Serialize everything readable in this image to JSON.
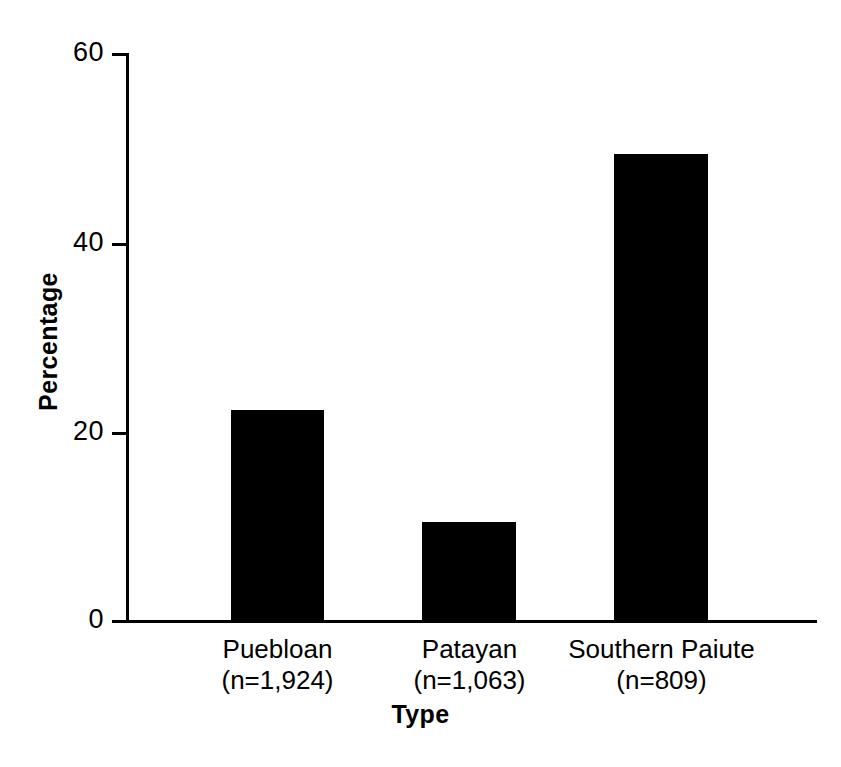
{
  "chart_data": {
    "type": "bar",
    "title": "",
    "subtitle": "",
    "xlabel": "Type",
    "ylabel": "Percentage",
    "categories": [
      "Puebloan",
      "Patayan",
      "Southern Paiute"
    ],
    "category_sublabels": [
      "(n=1,924)",
      "(n=1,063)",
      "(n=809)"
    ],
    "sample_sizes": [
      1924,
      1063,
      809
    ],
    "values": [
      22.2,
      10.4,
      49.3
    ],
    "ylim": [
      0,
      60
    ],
    "yticks": [
      0,
      20,
      40,
      60
    ],
    "ytick_labels": [
      "0",
      "20",
      "40",
      "60"
    ],
    "grid": false,
    "legend": false,
    "bar_color": "#000000",
    "axis_color": "#000000",
    "background_color": "#ffffff"
  },
  "axis": {
    "y_labels": [
      "60",
      "40",
      "20",
      "0"
    ],
    "y_title": "Percentage",
    "x_title": "Type"
  },
  "bars": [
    {
      "label": "Puebloan",
      "sublabel": "(n=1,924)",
      "value": 22.2
    },
    {
      "label": "Patayan",
      "sublabel": "(n=1,063)",
      "value": 10.4
    },
    {
      "label": "Southern Paiute",
      "sublabel": "(n=809)",
      "value": 49.3
    }
  ]
}
